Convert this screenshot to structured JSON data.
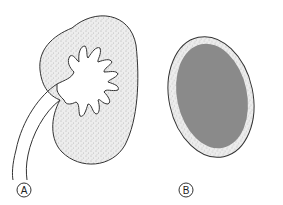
{
  "figure": {
    "panels": [
      {
        "label": "A",
        "description": "Normal kidney with branching calyces and ureter"
      },
      {
        "label": "B",
        "description": "Kidney with enlarged dark central region and thin cortex rim"
      }
    ],
    "colors": {
      "outline": "#333333",
      "stipple_fill": "#ebebeb",
      "dark_fill": "#8a8a8a",
      "background": "#ffffff"
    }
  }
}
